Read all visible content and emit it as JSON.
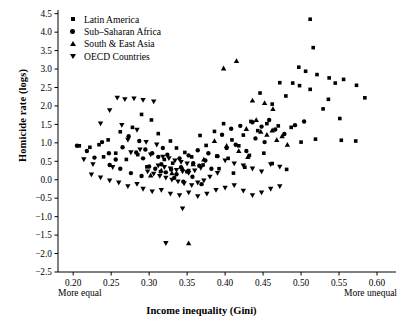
{
  "chart_data": {
    "type": "scatter",
    "title": "",
    "xlabel": "Income inequality (Gini)",
    "ylabel": "Homicide rate (logs)",
    "xlim": [
      0.18,
      0.625
    ],
    "ylim": [
      -2.5,
      4.6
    ],
    "xticks": [
      0.2,
      0.25,
      0.3,
      0.35,
      0.4,
      0.45,
      0.5,
      0.55,
      0.6
    ],
    "xticklabels": [
      "0.20",
      "0.25",
      "0.30",
      "0.35",
      "0.40",
      "0.45",
      "0.50",
      "0.55",
      "0.60"
    ],
    "yticks": [
      -2.5,
      -2.0,
      -1.5,
      -1.0,
      -0.5,
      0.0,
      0.5,
      1.0,
      1.5,
      2.0,
      2.5,
      3.0,
      3.5,
      4.0,
      4.5
    ],
    "yticklabels": [
      "-2.5",
      "-2.0",
      "-1.5",
      "-1.0",
      "-0.5",
      "0.0",
      "0.5",
      "1.0",
      "1.5",
      "2.0",
      "2.5",
      "3.0",
      "3.5",
      "4.0",
      "4.5"
    ],
    "grid": false,
    "legend_position": "top-left",
    "x_axis_annotations": {
      "left": "More equal",
      "right": "More unequal"
    },
    "series": [
      {
        "name": "Latin America",
        "marker": "square",
        "color": "#000000",
        "points": [
          [
            0.472,
            2.63
          ],
          [
            0.48,
            2.27
          ],
          [
            0.512,
            4.35
          ],
          [
            0.516,
            3.58
          ],
          [
            0.497,
            3.05
          ],
          [
            0.506,
            2.94
          ],
          [
            0.521,
            2.85
          ],
          [
            0.537,
            2.76
          ],
          [
            0.489,
            2.62
          ],
          [
            0.498,
            2.55
          ],
          [
            0.545,
            2.62
          ],
          [
            0.556,
            2.72
          ],
          [
            0.512,
            2.45
          ],
          [
            0.536,
            2.18
          ],
          [
            0.573,
            2.56
          ],
          [
            0.584,
            2.22
          ],
          [
            0.529,
            1.92
          ],
          [
            0.551,
            1.66
          ],
          [
            0.462,
            2.05
          ],
          [
            0.446,
            2.35
          ],
          [
            0.434,
            1.58
          ],
          [
            0.455,
            1.52
          ],
          [
            0.47,
            1.46
          ],
          [
            0.443,
            1.33
          ],
          [
            0.487,
            1.42
          ],
          [
            0.424,
            1.21
          ],
          [
            0.409,
            1.08
          ],
          [
            0.418,
            0.92
          ],
          [
            0.519,
            1.1
          ],
          [
            0.553,
            1.07
          ],
          [
            0.572,
            1.05
          ],
          [
            0.5,
            1.02
          ],
          [
            0.398,
            1.52
          ],
          [
            0.386,
            1.31
          ],
          [
            0.375,
            0.93
          ],
          [
            0.367,
            1.2
          ],
          [
            0.432,
            0.66
          ],
          [
            0.451,
            0.72
          ],
          [
            0.404,
            0.58
          ],
          [
            0.389,
            0.64
          ],
          [
            0.347,
            0.74
          ],
          [
            0.356,
            0.62
          ],
          [
            0.336,
            0.86
          ],
          [
            0.32,
            0.55
          ],
          [
            0.303,
            1.62
          ],
          [
            0.29,
            1.77
          ],
          [
            0.278,
            1.42
          ],
          [
            0.262,
            1.3
          ],
          [
            0.246,
            1.08
          ],
          [
            0.234,
            0.95
          ],
          [
            0.222,
            0.88
          ],
          [
            0.208,
            0.92
          ],
          [
            0.256,
            0.72
          ],
          [
            0.24,
            0.62
          ],
          [
            0.27,
            0.55
          ],
          [
            0.285,
            0.68
          ],
          [
            0.312,
            1.25
          ],
          [
            0.328,
            1.05
          ],
          [
            0.297,
            0.35
          ],
          [
            0.315,
            0.22
          ],
          [
            0.331,
            0.45
          ],
          [
            0.352,
            0.25
          ],
          [
            0.371,
            0.4
          ],
          [
            0.392,
            0.3
          ],
          [
            0.411,
            0.18
          ],
          [
            0.426,
            0.34
          ],
          [
            0.462,
            0.44
          ],
          [
            0.481,
            0.28
          ]
        ]
      },
      {
        "name": "Sub–Saharan Africa",
        "marker": "circle",
        "color": "#000000",
        "points": [
          [
            0.205,
            0.92
          ],
          [
            0.218,
            0.78
          ],
          [
            0.228,
            0.6
          ],
          [
            0.238,
            1.02
          ],
          [
            0.247,
            0.72
          ],
          [
            0.256,
            0.55
          ],
          [
            0.265,
            0.88
          ],
          [
            0.273,
            1.18
          ],
          [
            0.283,
            0.74
          ],
          [
            0.292,
            0.58
          ],
          [
            0.3,
            0.36
          ],
          [
            0.308,
            0.3
          ],
          [
            0.316,
            0.42
          ],
          [
            0.322,
            0.2
          ],
          [
            0.329,
            0.28
          ],
          [
            0.336,
            0.15
          ],
          [
            0.342,
            0.34
          ],
          [
            0.35,
            0.22
          ],
          [
            0.358,
            0.45
          ],
          [
            0.366,
            0.38
          ],
          [
            0.374,
            0.52
          ],
          [
            0.382,
            0.3
          ],
          [
            0.295,
            0.82
          ],
          [
            0.287,
            1.05
          ],
          [
            0.312,
            0.62
          ],
          [
            0.324,
            0.68
          ],
          [
            0.34,
            0.58
          ],
          [
            0.352,
            0.66
          ],
          [
            0.364,
            0.8
          ],
          [
            0.378,
            0.72
          ],
          [
            0.39,
            0.64
          ],
          [
            0.402,
            0.86
          ],
          [
            0.414,
            0.95
          ],
          [
            0.428,
            0.78
          ],
          [
            0.44,
            1.12
          ],
          [
            0.452,
            1.02
          ],
          [
            0.466,
            1.36
          ],
          [
            0.478,
            1.24
          ],
          [
            0.492,
            1.48
          ],
          [
            0.504,
            1.58
          ],
          [
            0.333,
            0.05
          ],
          [
            0.345,
            -0.05
          ],
          [
            0.357,
            0.08
          ],
          [
            0.369,
            -0.12
          ],
          [
            0.248,
            0.4
          ],
          [
            0.262,
            0.3
          ],
          [
            0.276,
            0.18
          ],
          [
            0.29,
            0.1
          ],
          [
            0.304,
            0.72
          ],
          [
            0.318,
            0.86
          ],
          [
            0.396,
            1.22
          ],
          [
            0.408,
            1.38
          ],
          [
            0.42,
            1.46
          ],
          [
            0.436,
            1.56
          ],
          [
            0.448,
            1.44
          ],
          [
            0.458,
            1.62
          ]
        ]
      },
      {
        "name": "South & East Asia",
        "marker": "triangle-up",
        "color": "#000000",
        "points": [
          [
            0.398,
            3.02
          ],
          [
            0.415,
            3.22
          ],
          [
            0.436,
            2.15
          ],
          [
            0.452,
            2.08
          ],
          [
            0.463,
            1.92
          ],
          [
            0.441,
            1.62
          ],
          [
            0.428,
            1.38
          ],
          [
            0.447,
            1.3
          ],
          [
            0.455,
            1.22
          ],
          [
            0.462,
            1.34
          ],
          [
            0.386,
            1.05
          ],
          [
            0.402,
            0.92
          ],
          [
            0.418,
            0.78
          ],
          [
            0.372,
            0.55
          ],
          [
            0.358,
            0.42
          ],
          [
            0.344,
            0.3
          ],
          [
            0.33,
            0.18
          ],
          [
            0.316,
            0.25
          ],
          [
            0.302,
            0.12
          ],
          [
            0.352,
            -1.72
          ],
          [
            0.475,
            1.18
          ],
          [
            0.468,
            1.08
          ],
          [
            0.482,
            0.95
          ],
          [
            0.43,
            0.62
          ]
        ]
      },
      {
        "name": "OECD Countries",
        "marker": "triangle-down",
        "color": "#000000",
        "points": [
          [
            0.258,
            2.22
          ],
          [
            0.268,
            2.18
          ],
          [
            0.28,
            2.2
          ],
          [
            0.292,
            2.16
          ],
          [
            0.306,
            2.12
          ],
          [
            0.248,
            1.88
          ],
          [
            0.236,
            1.52
          ],
          [
            0.264,
            1.48
          ],
          [
            0.284,
            1.35
          ],
          [
            0.272,
            1.08
          ],
          [
            0.296,
            1.02
          ],
          [
            0.31,
            0.95
          ],
          [
            0.288,
            0.82
          ],
          [
            0.276,
            0.74
          ],
          [
            0.302,
            0.68
          ],
          [
            0.318,
            0.62
          ],
          [
            0.326,
            0.58
          ],
          [
            0.334,
            0.52
          ],
          [
            0.342,
            0.48
          ],
          [
            0.35,
            0.44
          ],
          [
            0.312,
            0.38
          ],
          [
            0.32,
            0.34
          ],
          [
            0.328,
            0.3
          ],
          [
            0.336,
            0.26
          ],
          [
            0.344,
            0.22
          ],
          [
            0.352,
            0.18
          ],
          [
            0.36,
            0.25
          ],
          [
            0.368,
            0.32
          ],
          [
            0.298,
            0.22
          ],
          [
            0.306,
            0.16
          ],
          [
            0.314,
            0.1
          ],
          [
            0.322,
            0.05
          ],
          [
            0.33,
            0.0
          ],
          [
            0.338,
            -0.05
          ],
          [
            0.346,
            -0.1
          ],
          [
            0.356,
            -0.15
          ],
          [
            0.364,
            -0.08
          ],
          [
            0.372,
            -0.02
          ],
          [
            0.38,
            0.08
          ],
          [
            0.39,
            0.18
          ],
          [
            0.284,
            -0.12
          ],
          [
            0.272,
            -0.18
          ],
          [
            0.26,
            -0.08
          ],
          [
            0.248,
            -0.02
          ],
          [
            0.236,
            0.06
          ],
          [
            0.224,
            0.14
          ],
          [
            0.292,
            -0.25
          ],
          [
            0.304,
            -0.32
          ],
          [
            0.316,
            -0.28
          ],
          [
            0.328,
            -0.38
          ],
          [
            0.34,
            -0.42
          ],
          [
            0.352,
            -0.35
          ],
          [
            0.364,
            -0.45
          ],
          [
            0.376,
            -0.38
          ],
          [
            0.388,
            -0.28
          ],
          [
            0.4,
            -0.22
          ],
          [
            0.412,
            -0.15
          ],
          [
            0.424,
            -0.3
          ],
          [
            0.436,
            -0.42
          ],
          [
            0.448,
            -0.35
          ],
          [
            0.46,
            -0.25
          ],
          [
            0.472,
            -0.18
          ],
          [
            0.344,
            -0.78
          ],
          [
            0.322,
            -1.72
          ],
          [
            0.4,
            0.52
          ],
          [
            0.412,
            0.44
          ],
          [
            0.424,
            0.38
          ],
          [
            0.436,
            0.3
          ],
          [
            0.448,
            0.22
          ],
          [
            0.46,
            0.42
          ],
          [
            0.472,
            0.35
          ],
          [
            0.252,
            0.34
          ],
          [
            0.226,
            0.42
          ],
          [
            0.214,
            0.55
          ]
        ]
      }
    ]
  },
  "legend": {
    "items": [
      {
        "label": "Latin America",
        "marker": "square"
      },
      {
        "label": "Sub–Saharan Africa",
        "marker": "circle"
      },
      {
        "label": "South & East Asia",
        "marker": "triangle-up"
      },
      {
        "label": "OECD Countries",
        "marker": "triangle-down"
      }
    ]
  }
}
